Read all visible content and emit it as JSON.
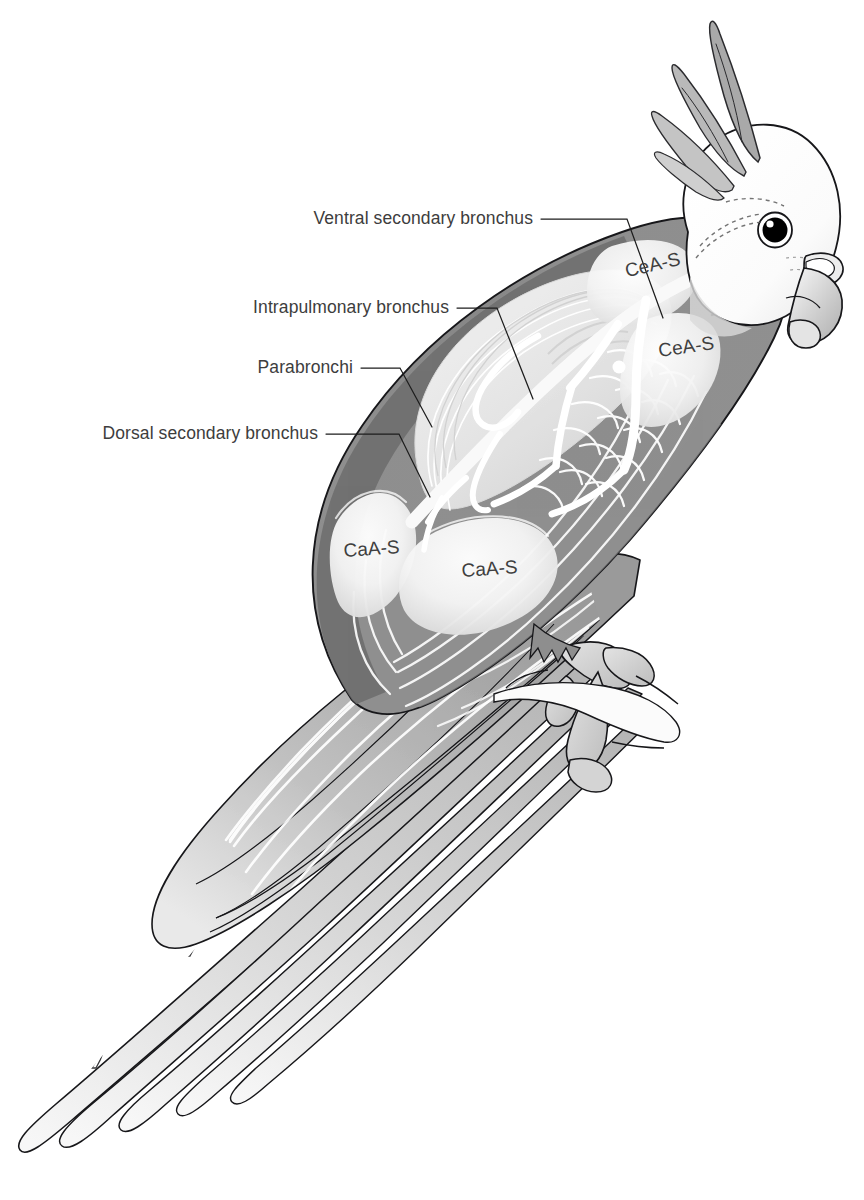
{
  "figure": {
    "view": "lateral",
    "background_color": "#ffffff",
    "ink_color": "#17171a",
    "label_text_color": "#3d3d3d",
    "leader_line_color": "#1d1d1d",
    "body_fill_color": "#8c8c8c",
    "body_shadow_color": "#6f6f6f",
    "airsac_fill_color": "#f0f0f0",
    "head_fill_color": "#fcfcfc",
    "bronchus_color": "#ffffff",
    "eye_color": "#000000",
    "tail_gradient": [
      "#b9b9b9",
      "#f4f4f4"
    ]
  },
  "callouts": [
    {
      "id": "ventral-secondary-bronchus",
      "label": "Ventral secondary bronchus",
      "text_x": 533,
      "text_y": 224,
      "leader": "M 541 219 L 627 219 L 663 318"
    },
    {
      "id": "intrapulmonary-bronchus",
      "label": "Intrapulmonary bronchus",
      "text_x": 449,
      "text_y": 313,
      "leader": "M 457 308 L 497 308 L 533 399"
    },
    {
      "id": "parabronchi",
      "label": "Parabronchi",
      "text_x": 353,
      "text_y": 373,
      "leader": "M 361 368 L 400 368 L 432 427"
    },
    {
      "id": "dorsal-secondary-bronchus",
      "label": "Dorsal secondary bronchus",
      "text_x": 318,
      "text_y": 439,
      "leader": "M 326 434 L 399 434 L 430 497"
    }
  ],
  "air_sacs": [
    {
      "id": "ceas-cranial-dorsal",
      "label": "CeA-S",
      "x": 654,
      "y": 271,
      "rotation": -13
    },
    {
      "id": "ceas-cranial-ventral",
      "label": "CeA-S",
      "x": 687,
      "y": 353,
      "rotation": -8
    },
    {
      "id": "caas-caudal-dorsal",
      "label": "CaA-S",
      "x": 372,
      "y": 555,
      "rotation": -4
    },
    {
      "id": "caas-caudal-ventral",
      "label": "CaA-S",
      "x": 490,
      "y": 575,
      "rotation": -4
    }
  ],
  "legend_keys": [
    {
      "abbr": "CeA-S",
      "meaning": "Cranial air sac"
    },
    {
      "abbr": "CaA-S",
      "meaning": "Caudal air sac"
    }
  ]
}
